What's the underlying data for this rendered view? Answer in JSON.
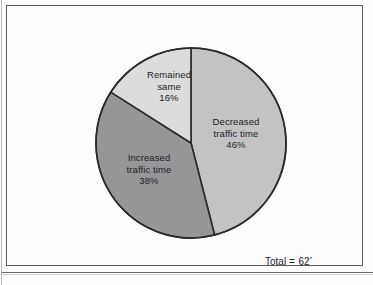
{
  "figure": {
    "total_note_label": "Total",
    "total_note_equals": "=",
    "total_note_value": "62",
    "total_note_footnote": "*"
  },
  "chart_data": {
    "type": "pie",
    "title": "",
    "subtitle": "",
    "xlabel": "",
    "ylabel": "",
    "legend_position": "none",
    "labels_placement": "inside-slices",
    "start_angle_deg": 0,
    "direction": "clockwise",
    "total_annotation": "Total = 62*",
    "total_value": 62,
    "categories": [
      "Decreased traffic time",
      "Increased traffic time",
      "Remained same"
    ],
    "values": [
      46,
      38,
      16
    ],
    "units": "percent",
    "colors": [
      "#c3c3c3",
      "#969696",
      "#dcdcdc"
    ],
    "stroke_color": "#2b2b2b",
    "slices": [
      {
        "name": "Decreased traffic time",
        "value": 46,
        "percent_label": "46%",
        "label_line1": "Decreased",
        "label_line2": "traffic time",
        "label_line3": "46%",
        "color": "#c3c3c3",
        "start_deg": 0,
        "end_deg": 165.6
      },
      {
        "name": "Increased traffic time",
        "value": 38,
        "percent_label": "38%",
        "label_line1": "Increased",
        "label_line2": "traffic time",
        "label_line3": "38%",
        "color": "#969696",
        "start_deg": 165.6,
        "end_deg": 302.4
      },
      {
        "name": "Remained same",
        "value": 16,
        "percent_label": "16%",
        "label_line1": "Remained",
        "label_line2": "same",
        "label_line3": "16%",
        "color": "#dcdcdc",
        "start_deg": 302.4,
        "end_deg": 360
      }
    ]
  }
}
